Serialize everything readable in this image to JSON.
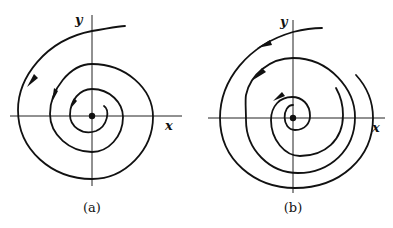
{
  "figure": {
    "panels": [
      {
        "id": "a",
        "caption": "(a)",
        "x_label": "x",
        "y_label": "y",
        "description": "Unstable spiral: trajectory spirals outward from the origin (counter-clockwise)",
        "arrow_direction": "counter-clockwise"
      },
      {
        "id": "b",
        "caption": "(b)",
        "x_label": "x",
        "y_label": "y",
        "description": "Spiral trajectories around the origin with multiple separate curves (counter-clockwise)",
        "arrow_direction": "counter-clockwise"
      }
    ],
    "colors": {
      "ink": "#111111",
      "background": "#ffffff"
    }
  }
}
